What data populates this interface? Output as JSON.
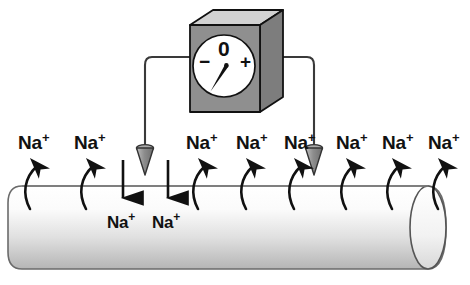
{
  "figure": {
    "background_color": "#ffffff",
    "ink_color": "#111111"
  },
  "meter": {
    "name": "voltmeter",
    "dial": {
      "zero_label": "0",
      "negative_label": "−",
      "positive_label": "+",
      "needle_direction": "down-left",
      "face_color": "#ffffff"
    },
    "box": {
      "front_color": "#8c8c8c",
      "top_color": "#d2d2d2",
      "side_color": "#7a7a7a",
      "outline_color": "#111111"
    }
  },
  "wires": {
    "left_wire_label": "left-electrode-wire",
    "right_wire_label": "right-electrode-wire",
    "color": "#333333"
  },
  "electrodes": [
    {
      "name": "left-electrode",
      "fill": "#9a9a9a"
    },
    {
      "name": "right-electrode",
      "fill": "#9a9a9a"
    }
  ],
  "axon": {
    "name": "axon-cylinder",
    "fill_top": "#ffffff",
    "fill_bottom": "#b8b8b8",
    "outline_color": "#555555"
  },
  "ions": {
    "species": "Na",
    "charge": "+",
    "outside_labels": [
      {
        "text": "Na",
        "charge": "+",
        "x": 18,
        "y": 133
      },
      {
        "text": "Na",
        "charge": "+",
        "x": 74,
        "y": 133
      },
      {
        "text": "Na",
        "charge": "+",
        "x": 186,
        "y": 133
      },
      {
        "text": "Na",
        "charge": "+",
        "x": 236,
        "y": 133
      },
      {
        "text": "Na",
        "charge": "+",
        "x": 284,
        "y": 133
      },
      {
        "text": "Na",
        "charge": "+",
        "x": 336,
        "y": 133
      },
      {
        "text": "Na",
        "charge": "+",
        "x": 382,
        "y": 133
      },
      {
        "text": "Na",
        "charge": "+",
        "x": 428,
        "y": 133
      }
    ],
    "inside_labels": [
      {
        "text": "Na",
        "charge": "+",
        "x": 107,
        "y": 214
      },
      {
        "text": "Na",
        "charge": "+",
        "x": 152,
        "y": 214
      }
    ]
  },
  "arrows": {
    "efflux_name": "efflux-arrow",
    "influx_name": "influx-arrow",
    "efflux_count": 8,
    "influx_count": 2,
    "color": "#111111"
  }
}
